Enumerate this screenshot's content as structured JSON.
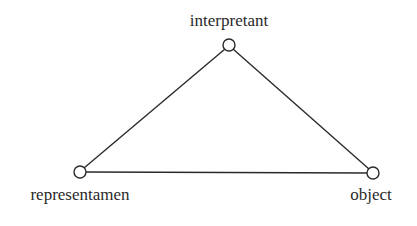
{
  "diagram": {
    "type": "semiotic-triangle",
    "nodes": [
      {
        "id": "interpretant",
        "label": "interpretant",
        "x": 229,
        "y": 45
      },
      {
        "id": "representamen",
        "label": "representamen",
        "x": 80,
        "y": 172
      },
      {
        "id": "object",
        "label": "object",
        "x": 373,
        "y": 173
      }
    ],
    "edges": [
      {
        "from": "representamen",
        "to": "interpretant"
      },
      {
        "from": "interpretant",
        "to": "object"
      },
      {
        "from": "representamen",
        "to": "object"
      }
    ],
    "colors": {
      "line": "#2a2a2a",
      "node_fill": "#ffffff",
      "text": "#2a2a2a"
    }
  }
}
